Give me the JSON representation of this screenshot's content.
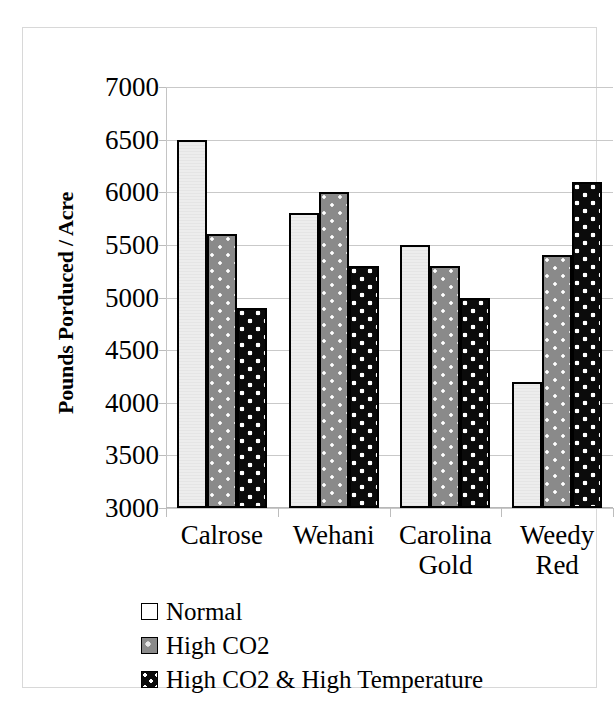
{
  "chart_data": {
    "type": "bar",
    "title": "",
    "xlabel": "",
    "ylabel": "Pounds Porduced / Acre",
    "ylim": [
      3000,
      7000
    ],
    "ytick_step": 500,
    "yticks": [
      7000,
      6500,
      6000,
      5500,
      5000,
      4500,
      4000,
      3500,
      3000
    ],
    "ytick_labels": [
      "7000",
      "6500",
      "6000",
      "5500",
      "5000",
      "4500",
      "4000",
      "3500",
      "3000"
    ],
    "categories": [
      "Calrose",
      "Wehani",
      "Carolina Gold",
      "Weedy Red"
    ],
    "category_lines": [
      [
        "Calrose"
      ],
      [
        "Wehani"
      ],
      [
        "Carolina",
        "Gold"
      ],
      [
        "Weedy",
        "Red"
      ]
    ],
    "grid": true,
    "grid_axis": "y",
    "legend_position": "bottom-left",
    "series": [
      {
        "name": "Normal",
        "fill": "white",
        "color": "#ededed",
        "values": [
          6500,
          5800,
          5500,
          4200
        ]
      },
      {
        "name": "High CO2",
        "fill": "gray-dotted",
        "color": "#8a8a8a",
        "values": [
          5600,
          6000,
          5300,
          5400
        ]
      },
      {
        "name": "High CO2 & High Temperature",
        "fill": "black-dotted",
        "color": "#0b0b0b",
        "values": [
          4900,
          5300,
          5000,
          6100
        ]
      }
    ]
  },
  "legend": {
    "items": [
      {
        "label": "Normal"
      },
      {
        "label": "High CO2"
      },
      {
        "label": "High CO2 & High Temperature"
      }
    ]
  },
  "colors": {
    "series_normal": "#ededed",
    "series_high_co2": "#8a8a8a",
    "series_high_co2_temp": "#0b0b0b",
    "gridline": "#c9c9c9",
    "frame": "#d8d8d8",
    "text": "#000000"
  }
}
